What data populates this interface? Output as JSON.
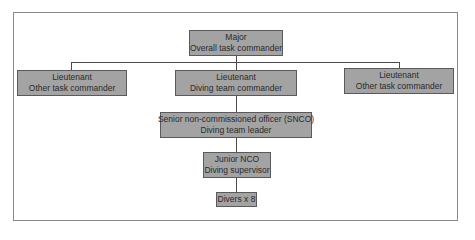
{
  "diagram": {
    "type": "org-chart",
    "nodes": [
      {
        "id": "major",
        "line1": "Major",
        "line2": "Overall task commander"
      },
      {
        "id": "lt_left",
        "line1": "Lieutenant",
        "line2": "Other task commander"
      },
      {
        "id": "lt_center",
        "line1": "Lieutenant",
        "line2": "Diving team commander"
      },
      {
        "id": "lt_right",
        "line1": "Lieutenant",
        "line2": "Other task commander"
      },
      {
        "id": "snco",
        "line1": "Senior non-commissioned officer (SNCO)",
        "line2": "Diving team leader"
      },
      {
        "id": "jnco",
        "line1": "Junior NCO",
        "line2": "Diving supervisor"
      },
      {
        "id": "divers",
        "line1": "Divers x 8"
      }
    ],
    "edges": [
      [
        "major",
        "lt_left"
      ],
      [
        "major",
        "lt_center"
      ],
      [
        "major",
        "lt_right"
      ],
      [
        "lt_center",
        "snco"
      ],
      [
        "snco",
        "jnco"
      ],
      [
        "jnco",
        "divers"
      ]
    ],
    "colors": {
      "box_fill": "#a3a3a3",
      "box_border": "#5a5a5a",
      "connector": "#4a4a4a",
      "frame": "#8a8a8a"
    }
  }
}
